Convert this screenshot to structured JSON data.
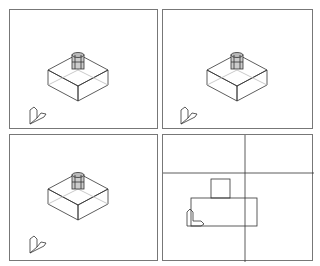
{
  "app": {
    "title": "CAD four-viewport layout"
  },
  "viewports": [
    {
      "id": "top-left",
      "view": "isometric",
      "label": ""
    },
    {
      "id": "top-right",
      "view": "isometric",
      "label": ""
    },
    {
      "id": "bottom-left",
      "view": "isometric",
      "label": ""
    },
    {
      "id": "bottom-right",
      "view": "front",
      "label": ""
    }
  ],
  "colors": {
    "border": "#777777",
    "lines": "#333333",
    "background": "#ffffff"
  }
}
